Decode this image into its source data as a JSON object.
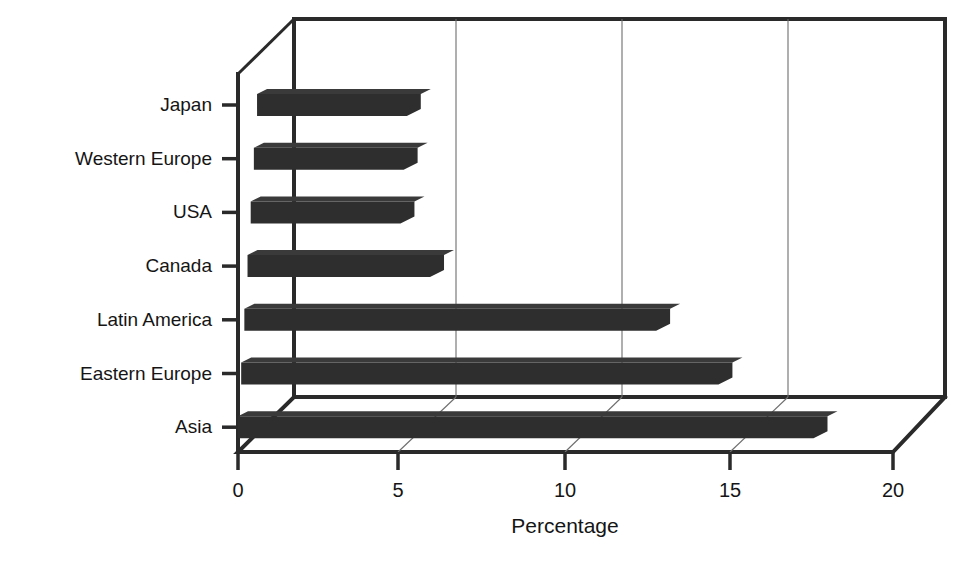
{
  "chart_data": {
    "type": "bar",
    "orientation": "horizontal",
    "style": "3d-perspective",
    "title": "",
    "subtitle": "",
    "xlabel": "Percentage",
    "ylabel": "",
    "categories": [
      "Japan",
      "Western Europe",
      "USA",
      "Canada",
      "Latin America",
      "Eastern Europe",
      "Asia"
    ],
    "values": [
      5,
      5,
      5,
      6,
      13,
      15,
      18
    ],
    "series": [
      {
        "name": "Percentage",
        "values": [
          5,
          5,
          5,
          6,
          13,
          15,
          18
        ]
      }
    ],
    "xlim": [
      0,
      20
    ],
    "xticks": [
      0,
      5,
      10,
      15,
      20
    ],
    "xtick_labels": [
      "0",
      "5",
      "10",
      "15",
      "20"
    ],
    "grid": true,
    "grid_axis": "x",
    "legend": false,
    "legend_position": "none",
    "bar_color": "#2e2e2e",
    "background_color": "#ffffff",
    "axis_color": "#2a2a2a",
    "gridline_color": "#6d6d6d"
  },
  "axis": {
    "x_title": "Percentage",
    "tick_labels": [
      "0",
      "5",
      "10",
      "15",
      "20"
    ],
    "category_labels": [
      "Japan",
      "Western Europe",
      "USA",
      "Canada",
      "Latin America",
      "Eastern Europe",
      "Asia"
    ]
  }
}
